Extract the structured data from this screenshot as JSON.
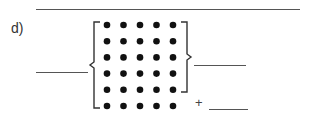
{
  "problem": {
    "label": "d)",
    "plus_sign": "+",
    "array": {
      "rows": 6,
      "columns": 5,
      "bracketed_rows_right": 5
    },
    "answer_blanks": {
      "total_left": "",
      "bracketed_right": "",
      "remaining_row": ""
    },
    "colors": {
      "dot": "#111111",
      "bracket": "#333333",
      "line": "#555555"
    }
  }
}
